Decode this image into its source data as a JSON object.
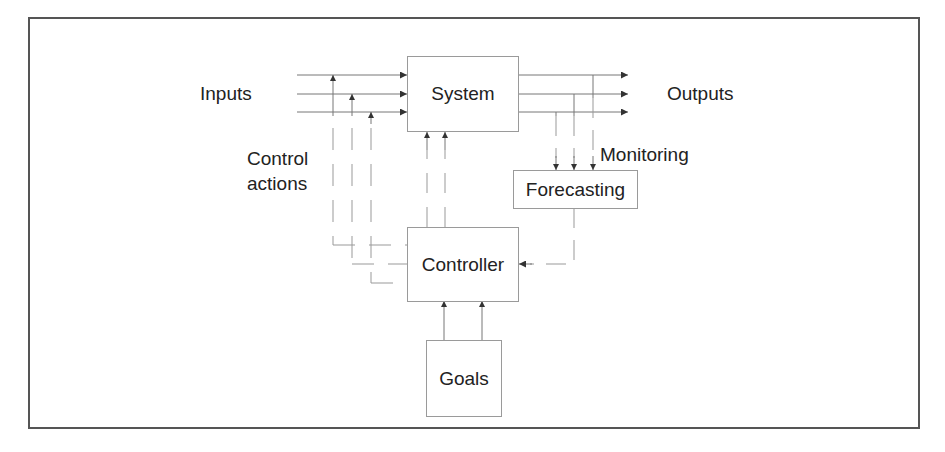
{
  "diagram": {
    "title": "",
    "colors": {
      "line": "#666666",
      "dashed": "#8a8a8a",
      "text": "#222222",
      "frame": "#555555"
    },
    "nodes": {
      "system": {
        "label": "System"
      },
      "forecasting": {
        "label": "Forecasting"
      },
      "controller": {
        "label": "Controller"
      },
      "goals": {
        "label": "Goals"
      }
    },
    "labels": {
      "inputs": "Inputs",
      "outputs": "Outputs",
      "control_actions_line1": "Control",
      "control_actions_line2": "actions",
      "monitoring": "Monitoring"
    },
    "edges": [
      {
        "from": "Inputs",
        "to": "System",
        "count": 3,
        "style": "solid"
      },
      {
        "from": "System",
        "to": "Outputs",
        "count": 3,
        "style": "solid"
      },
      {
        "from": "Outputs",
        "to": "Forecasting",
        "label": "Monitoring",
        "count": 3,
        "style": "dashed"
      },
      {
        "from": "Forecasting",
        "to": "Controller",
        "count": 1,
        "style": "dashed"
      },
      {
        "from": "Controller",
        "to": "Inputs",
        "label": "Control actions",
        "count": 3,
        "style": "dashed"
      },
      {
        "from": "Controller",
        "to": "System",
        "count": 2,
        "style": "dashed"
      },
      {
        "from": "Goals",
        "to": "Controller",
        "count": 2,
        "style": "solid"
      }
    ]
  }
}
